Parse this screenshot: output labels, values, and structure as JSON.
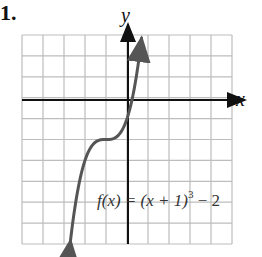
{
  "problem_number": "1.",
  "chart_data": {
    "type": "line",
    "title": "",
    "xlabel": "x",
    "ylabel": "y",
    "xlim": [
      -5,
      5
    ],
    "ylim": [
      -7,
      3
    ],
    "grid": true,
    "grid_step": 1,
    "legend": null,
    "annotations": [
      {
        "text": "f(x) = (x + 1)^3 − 2",
        "position": "lower right"
      }
    ],
    "series": [
      {
        "name": "f(x) = (x + 1)^3 − 2",
        "x": [
          -3.5,
          -3,
          -2.5,
          -2,
          -1.5,
          -1,
          -0.5,
          0,
          0.5,
          0.93
        ],
        "values": [
          -6.9,
          -10,
          -5.375,
          -3,
          -2.125,
          -2,
          -1.875,
          -1,
          1.375,
          2.9
        ]
      }
    ],
    "colors": {
      "curve": "#555555",
      "grid": "#bdbdbd",
      "axis": "#111111"
    }
  },
  "labels": {
    "x_axis": "x",
    "y_axis": "y",
    "equation_prefix": "f(x) = (x + 1)",
    "equation_exponent": "3",
    "equation_suffix": " − 2"
  }
}
